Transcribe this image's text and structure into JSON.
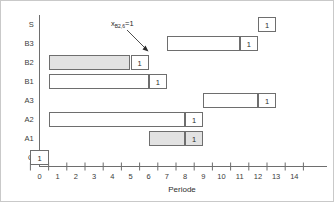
{
  "chart_data": {
    "type": "bar",
    "title": "",
    "subtitle": "",
    "xlabel": "Periode",
    "ylabel": "",
    "xlim": [
      0,
      15
    ],
    "xticks": [
      "0",
      "1",
      "2",
      "3",
      "4",
      "5",
      "6",
      "7",
      "8",
      "9",
      "10",
      "11",
      "12",
      "13",
      "14"
    ],
    "categories": [
      "Q",
      "A1",
      "A2",
      "A3",
      "B1",
      "B2",
      "B3",
      "S"
    ],
    "grid": false,
    "legend": null,
    "annotations": [
      {
        "text_main": "x",
        "text_sub": "B2,6",
        "text_tail": "=1",
        "full_text": "xB2,6=1",
        "points_to": "B2-marker-cell"
      }
    ],
    "bars": [
      {
        "category": "Q",
        "row": 7,
        "body": null,
        "marker": {
          "start": 0,
          "end": 1,
          "value": "1",
          "shaded": false
        }
      },
      {
        "category": "A1",
        "row": 6,
        "body": {
          "start": 6.5,
          "end": 8.5,
          "shaded": true
        },
        "marker": {
          "start": 8.5,
          "end": 9.5,
          "value": "1",
          "shaded": true
        }
      },
      {
        "category": "A2",
        "row": 5,
        "body": {
          "start": 1,
          "end": 8.5,
          "shaded": false
        },
        "marker": {
          "start": 8.5,
          "end": 9.5,
          "value": "1",
          "shaded": false
        }
      },
      {
        "category": "A3",
        "row": 4,
        "body": {
          "start": 9.5,
          "end": 12.5,
          "shaded": false
        },
        "marker": {
          "start": 12.5,
          "end": 13.5,
          "value": "1",
          "shaded": false
        }
      },
      {
        "category": "B1",
        "row": 3,
        "body": {
          "start": 1,
          "end": 6.5,
          "shaded": false
        },
        "marker": {
          "start": 6.5,
          "end": 7.5,
          "value": "1",
          "shaded": false
        }
      },
      {
        "category": "B2",
        "row": 2,
        "body": {
          "start": 1,
          "end": 5.5,
          "shaded": true
        },
        "marker": {
          "start": 5.5,
          "end": 6.5,
          "value": "1",
          "shaded": false
        }
      },
      {
        "category": "B3",
        "row": 1,
        "body": {
          "start": 7.5,
          "end": 11.5,
          "shaded": false
        },
        "marker": {
          "start": 11.5,
          "end": 12.5,
          "value": "1",
          "shaded": false
        }
      },
      {
        "category": "S",
        "row": 0,
        "body": null,
        "marker": {
          "start": 12.5,
          "end": 13.5,
          "value": "1",
          "shaded": false
        }
      }
    ]
  }
}
